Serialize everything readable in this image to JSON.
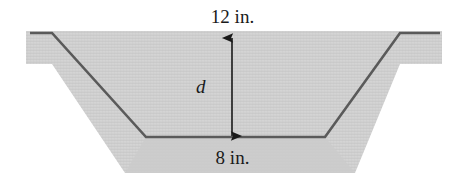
{
  "figure": {
    "kind": "cross-section-diagram",
    "labels": {
      "top_width": "12 in.",
      "bottom_width": "8 in.",
      "depth": "d"
    },
    "colors": {
      "background": "#ffffff",
      "fill": "#d2d2d2",
      "fill_shade": "#c9c9c9",
      "outline": "#5a5a5a",
      "arrow": "#1a1a1a",
      "text": "#1a1a1a"
    },
    "geometry": {
      "top_flange_left": {
        "x1": 30,
        "y1": 33,
        "x2": 52,
        "y2": 33
      },
      "top_flange_right": {
        "x1": 400,
        "y1": 33,
        "x2": 440,
        "y2": 33
      },
      "wall_left": {
        "x1": 52,
        "y1": 33,
        "x2": 146,
        "y2": 137
      },
      "wall_right": {
        "x1": 325,
        "y1": 137,
        "x2": 400,
        "y2": 33
      },
      "floor": {
        "x1": 146,
        "y1": 137,
        "x2": 325,
        "y2": 137
      },
      "dimension_arrow": {
        "x": 232,
        "y_top": 38,
        "y_bottom": 136
      },
      "fill_outline": [
        [
          26,
          31
        ],
        [
          442,
          31
        ],
        [
          442,
          64
        ],
        [
          400,
          64
        ],
        [
          355,
          173
        ],
        [
          125,
          173
        ],
        [
          52,
          64
        ],
        [
          26,
          64
        ]
      ]
    }
  }
}
